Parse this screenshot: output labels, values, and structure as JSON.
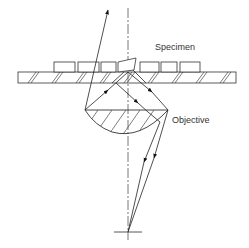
{
  "diagram": {
    "type": "optical-schematic",
    "labels": {
      "specimen": "Specimen",
      "objective": "Objective"
    },
    "colors": {
      "line": "#222222",
      "axis": "#555555",
      "text": "#333333",
      "background": "#ffffff"
    }
  }
}
